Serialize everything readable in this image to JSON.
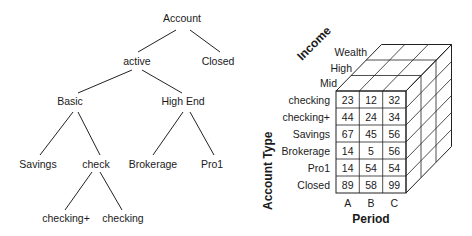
{
  "tree": {
    "nodes": [
      {
        "id": "account",
        "label": "Account",
        "x": 182,
        "y": 22
      },
      {
        "id": "active",
        "label": "active",
        "x": 137,
        "y": 62
      },
      {
        "id": "closed",
        "label": "Closed",
        "x": 218,
        "y": 62
      },
      {
        "id": "basic",
        "label": "Basic",
        "x": 66,
        "y": 102
      },
      {
        "id": "highend",
        "label": "High End",
        "x": 183,
        "y": 102
      },
      {
        "id": "savings",
        "label": "Savings",
        "x": 44,
        "y": 164
      },
      {
        "id": "check",
        "label": "check",
        "x": 97,
        "y": 164
      },
      {
        "id": "brokerage",
        "label": "Brokerage",
        "x": 153,
        "y": 164
      },
      {
        "id": "pro1",
        "label": "Pro1",
        "x": 211,
        "y": 164
      },
      {
        "id": "checkingplus",
        "label": "checking+",
        "x": 70,
        "y": 219
      },
      {
        "id": "checking",
        "label": "checking",
        "x": 123,
        "y": 219
      }
    ]
  },
  "cube": {
    "axes": {
      "income": "Income",
      "account_type": "Account Type",
      "period": "Period"
    },
    "income_levels": [
      "Wealth",
      "High",
      "Mid"
    ],
    "rows": [
      "checking",
      "checking+",
      "Savings",
      "Brokerage",
      "Pro1",
      "Closed"
    ],
    "columns": [
      "A",
      "B",
      "C"
    ],
    "values": [
      [
        "23",
        "12",
        "32"
      ],
      [
        "44",
        "24",
        "34"
      ],
      [
        "67",
        "45",
        "56"
      ],
      [
        "14",
        "5",
        "56"
      ],
      [
        "14",
        "54",
        "54"
      ],
      [
        "89",
        "58",
        "99"
      ]
    ]
  }
}
